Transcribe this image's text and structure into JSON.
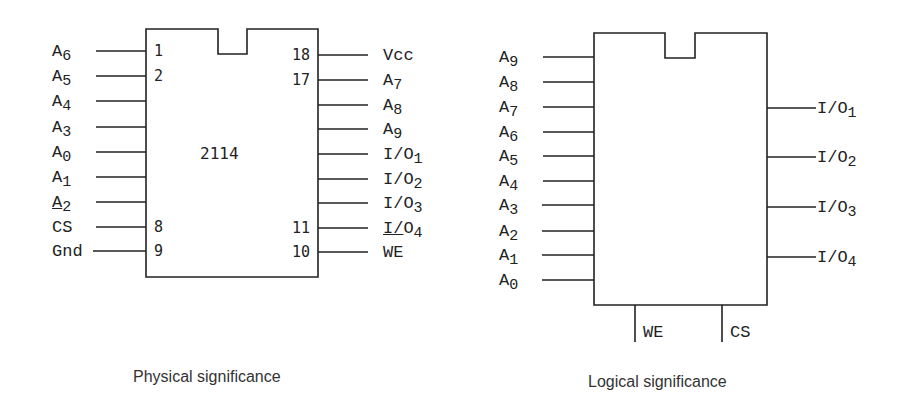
{
  "figure": {
    "physical": {
      "caption": "Physical significance",
      "chip_name": "2114",
      "left_pins": [
        {
          "num": "1",
          "base": "A",
          "sub": "6",
          "y": 51
        },
        {
          "num": "2",
          "base": "A",
          "sub": "5",
          "y": 76
        },
        {
          "num": "",
          "base": "A",
          "sub": "4",
          "y": 101
        },
        {
          "num": "",
          "base": "A",
          "sub": "3",
          "y": 127
        },
        {
          "num": "",
          "base": "A",
          "sub": "0",
          "y": 152
        },
        {
          "num": "",
          "base": "A",
          "sub": "1",
          "y": 177
        },
        {
          "num": "",
          "base": "A",
          "sub": "2",
          "y": 202,
          "underline_base": true
        },
        {
          "num": "8",
          "base": "CS",
          "sub": "",
          "y": 227
        },
        {
          "num": "9",
          "base": "Gnd",
          "sub": "",
          "y": 251
        }
      ],
      "right_pins": [
        {
          "num": "18",
          "base": "Vcc",
          "sub": "",
          "y": 55
        },
        {
          "num": "17",
          "base": "A",
          "sub": "7",
          "y": 80
        },
        {
          "num": "",
          "base": "A",
          "sub": "8",
          "y": 105
        },
        {
          "num": "",
          "base": "A",
          "sub": "9",
          "y": 129
        },
        {
          "num": "",
          "base": "I/O",
          "sub": "1",
          "y": 154
        },
        {
          "num": "",
          "base": "I/O",
          "sub": "2",
          "y": 179
        },
        {
          "num": "",
          "base": "I/O",
          "sub": "3",
          "y": 203
        },
        {
          "num": "11",
          "base": "I/O",
          "sub": "4",
          "y": 228,
          "underline_prefix": "I/"
        },
        {
          "num": "10",
          "base": "WE",
          "sub": "",
          "y": 252
        }
      ]
    },
    "logical": {
      "caption": "Logical significance",
      "left_pins": [
        {
          "base": "A",
          "sub": "9",
          "y": 57
        },
        {
          "base": "A",
          "sub": "8",
          "y": 82
        },
        {
          "base": "A",
          "sub": "7",
          "y": 107
        },
        {
          "base": "A",
          "sub": "6",
          "y": 132
        },
        {
          "base": "A",
          "sub": "5",
          "y": 156
        },
        {
          "base": "A",
          "sub": "4",
          "y": 181
        },
        {
          "base": "A",
          "sub": "3",
          "y": 205
        },
        {
          "base": "A",
          "sub": "2",
          "y": 231
        },
        {
          "base": "A",
          "sub": "1",
          "y": 255
        },
        {
          "base": "A",
          "sub": "0",
          "y": 280
        }
      ],
      "right_pins": [
        {
          "base": "I/O",
          "sub": "1",
          "y": 108
        },
        {
          "base": "I/O",
          "sub": "2",
          "y": 157
        },
        {
          "base": "I/O",
          "sub": "3",
          "y": 207
        },
        {
          "base": "I/O",
          "sub": "4",
          "y": 257
        }
      ],
      "bottom_pins": [
        {
          "base": "WE",
          "x": 635
        },
        {
          "base": "CS",
          "x": 722
        }
      ]
    },
    "line_color": "#222222"
  }
}
